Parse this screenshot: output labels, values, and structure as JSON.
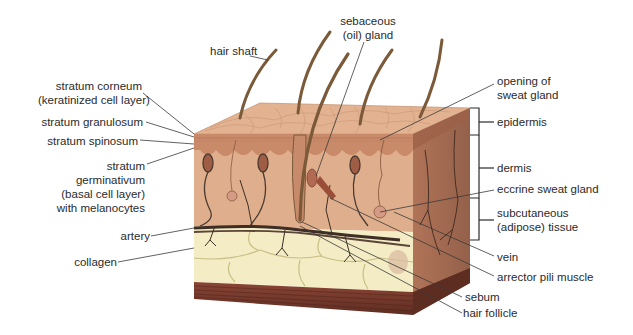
{
  "diagram": {
    "colors": {
      "skin_top": "#e2b08f",
      "skin_front": "#dfae8c",
      "epidermis": "#c98a6a",
      "side_face": "#a96e52",
      "adipose": "#f3ecc4",
      "adipose_lines": "#c9bf86",
      "muscle": "#7a3d2e",
      "hair": "#7b5a3a",
      "vessel": "#4a3a30",
      "label_text": "#2b2b2b",
      "leader_line": "#3a3a3a"
    },
    "labels_left": {
      "stratum_corneum": [
        "stratum corneum",
        "(keratinized cell layer)"
      ],
      "stratum_granulosum": "stratum granulosum",
      "stratum_spinosum": "stratum spinosum",
      "stratum_germinativum": [
        "stratum",
        "germinativum",
        "(basal cell layer)",
        "with melanocytes"
      ],
      "artery": "artery",
      "collagen": "collagen"
    },
    "labels_top": {
      "hair_shaft": "hair shaft",
      "sebaceous_gland": [
        "sebaceous",
        "(oil) gland"
      ]
    },
    "labels_right": {
      "opening_sweat_gland": [
        "opening of",
        "sweat gland"
      ],
      "epidermis": "epidermis",
      "dermis": "dermis",
      "eccrine_sweat_gland": "eccrine sweat gland",
      "subcutaneous": [
        "subcutaneous",
        "(adipose) tissue"
      ],
      "vein": "vein",
      "arrector_pili": "arrector pili muscle",
      "sebum": "sebum",
      "hair_follicle": "hair follicle"
    }
  }
}
